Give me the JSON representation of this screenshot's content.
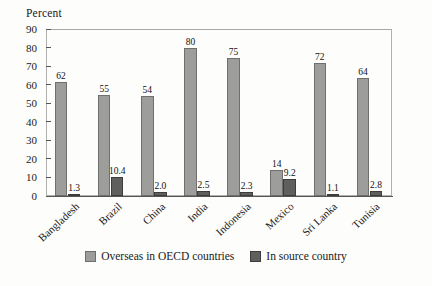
{
  "chart_data": {
    "type": "bar",
    "title": "",
    "xlabel": "",
    "ylabel": "Percent",
    "ylim": [
      0,
      90
    ],
    "yticks": [
      0,
      10,
      20,
      30,
      40,
      50,
      60,
      70,
      80,
      90
    ],
    "grid": false,
    "legend_position": "bottom-center",
    "categories": [
      "Bangladesh",
      "Brazil",
      "China",
      "India",
      "Indonesia",
      "Mexico",
      "Sri Lanka",
      "Tunisia"
    ],
    "series": [
      {
        "name": "Overseas in OECD countries",
        "color": "#9d9d9b",
        "values": [
          62,
          55,
          54,
          80,
          75,
          14,
          72,
          64
        ],
        "labels": [
          "62",
          "55",
          "54",
          "80",
          "75",
          "14",
          "72",
          "64"
        ]
      },
      {
        "name": "In source country",
        "color": "#5f5f5d",
        "values": [
          1.3,
          10.4,
          2.0,
          2.5,
          2.3,
          9.2,
          1.1,
          2.8
        ],
        "labels": [
          "1.3",
          "10.4",
          "2.0",
          "2.5",
          "2.3",
          "9.2",
          "1.1",
          "2.8"
        ]
      }
    ]
  },
  "axis": {
    "y_title": "Percent"
  },
  "legend": {
    "items": [
      {
        "label": "Overseas in OECD countries",
        "swatch": "s0"
      },
      {
        "label": "In source country",
        "swatch": "s1"
      }
    ]
  }
}
